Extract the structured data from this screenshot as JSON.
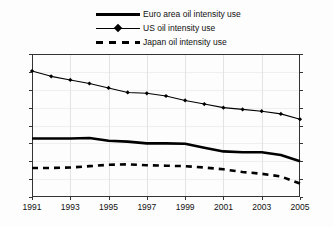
{
  "chart_data": {
    "type": "line",
    "title": "",
    "xlabel": "",
    "ylabel": "",
    "xlim": [
      1991,
      2005
    ],
    "ylim": [
      1,
      2.6
    ],
    "grid": true,
    "legend_position": "top-center",
    "dual_y_axis": true,
    "y_ticks": [
      "2.6",
      "2.4",
      "2.2",
      "2",
      "1.8",
      "1.6",
      "1.4",
      "1.2",
      "1"
    ],
    "y_tick_values": [
      2.6,
      2.4,
      2.2,
      2.0,
      1.8,
      1.6,
      1.4,
      1.2,
      1.0
    ],
    "x": [
      1991,
      1992,
      1993,
      1994,
      1995,
      1996,
      1997,
      1998,
      1999,
      2000,
      2001,
      2002,
      2003,
      2004,
      2005
    ],
    "x_tick_labels": [
      "1991",
      "1993",
      "1995",
      "1997",
      "1999",
      "2001",
      "2003",
      "2005"
    ],
    "x_tick_values": [
      1991,
      1993,
      1995,
      1997,
      1999,
      2001,
      2003,
      2005
    ],
    "series": [
      {
        "name": "Euro area oil intensity use",
        "style": "solid-thick",
        "color": "#000000",
        "markers": false,
        "values": [
          1.655,
          1.655,
          1.655,
          1.66,
          1.63,
          1.62,
          1.6,
          1.6,
          1.595,
          1.55,
          1.51,
          1.5,
          1.5,
          1.47,
          1.4
        ]
      },
      {
        "name": "US oil intensity use",
        "style": "solid-thin-marker",
        "color": "#000000",
        "markers": true,
        "values": [
          2.41,
          2.35,
          2.31,
          2.27,
          2.22,
          2.17,
          2.16,
          2.13,
          2.08,
          2.04,
          2.0,
          1.98,
          1.96,
          1.93,
          1.87
        ]
      },
      {
        "name": "Japan oil intensity use",
        "style": "dashed",
        "color": "#000000",
        "markers": false,
        "values": [
          1.325,
          1.325,
          1.33,
          1.345,
          1.36,
          1.365,
          1.355,
          1.35,
          1.345,
          1.33,
          1.31,
          1.28,
          1.26,
          1.23,
          1.15
        ]
      }
    ]
  },
  "legend": {
    "items": [
      {
        "label": "Euro area oil intensity use",
        "key": "solid-thick"
      },
      {
        "label": "US oil intensity use",
        "key": "solid-thin-marker"
      },
      {
        "label": "Japan oil intensity use",
        "key": "dashed"
      }
    ]
  }
}
